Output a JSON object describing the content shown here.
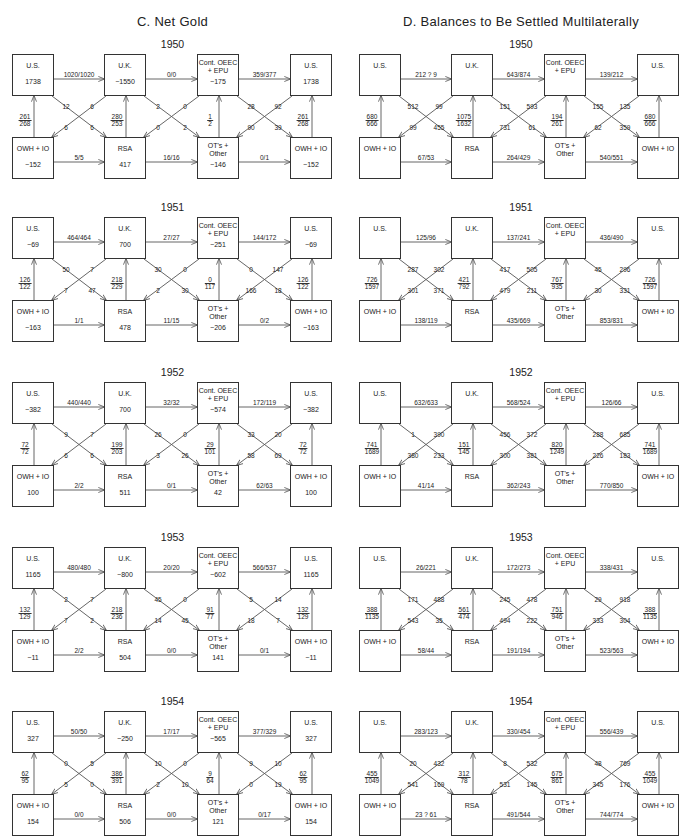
{
  "panels": [
    {
      "id": "C",
      "title": "C.  Net Gold",
      "years": [
        {
          "year": "1950",
          "values": {
            "us_l": "1738",
            "uk": "−1550",
            "oeec": "−175",
            "us_r": "1738",
            "owh_l": "−152",
            "rsa": "417",
            "ot": "−146",
            "owh_r": "−152"
          },
          "h_top": [
            "1020/1020",
            "0/0",
            "359/377"
          ],
          "h_bot": [
            "5/5",
            "16/16",
            "0/1"
          ],
          "v": [
            [
              "261",
              "268"
            ],
            [
              "280",
              "253"
            ],
            [
              "1",
              "2"
            ],
            [
              "261",
              "268"
            ]
          ],
          "x1": [
            "12",
            "6",
            "6",
            "6"
          ],
          "x2": [
            "2",
            "0",
            "0",
            "2"
          ],
          "x3": [
            "28",
            "92",
            "90",
            "39"
          ]
        },
        {
          "year": "1951",
          "values": {
            "us_l": "−69",
            "uk": "700",
            "oeec": "−251",
            "us_r": "−69",
            "owh_l": "−163",
            "rsa": "478",
            "ot": "−206",
            "owh_r": "−163"
          },
          "h_top": [
            "464/464",
            "27/27",
            "144/172"
          ],
          "h_bot": [
            "1/1",
            "11/15",
            "0/2"
          ],
          "v": [
            [
              "126",
              "122"
            ],
            [
              "218",
              "229"
            ],
            [
              "0",
              "117"
            ],
            [
              "126",
              "122"
            ]
          ],
          "x1": [
            "50",
            "7",
            "7",
            "47"
          ],
          "x2": [
            "30",
            "0",
            "2",
            "30"
          ],
          "x3": [
            "0",
            "147",
            "166",
            "18"
          ]
        },
        {
          "year": "1952",
          "values": {
            "us_l": "−382",
            "uk": "700",
            "oeec": "−574",
            "us_r": "−382",
            "owh_l": "100",
            "rsa": "511",
            "ot": "42",
            "owh_r": "100"
          },
          "h_top": [
            "440/440",
            "32/32",
            "172/119"
          ],
          "h_bot": [
            "2/2",
            "0/1",
            "62/63"
          ],
          "v": [
            [
              "72",
              "72"
            ],
            [
              "199",
              "203"
            ],
            [
              "29",
              "101"
            ],
            [
              "72",
              "72"
            ]
          ],
          "x1": [
            "9",
            "7",
            "6",
            "6"
          ],
          "x2": [
            "26",
            "0",
            "3",
            "26"
          ],
          "x3": [
            "33",
            "20",
            "58",
            "69"
          ]
        },
        {
          "year": "1953",
          "values": {
            "us_l": "1165",
            "uk": "−800",
            "oeec": "−602",
            "us_r": "1165",
            "owh_l": "−11",
            "rsa": "504",
            "ot": "141",
            "owh_r": "−11"
          },
          "h_top": [
            "480/480",
            "20/20",
            "566/537"
          ],
          "h_bot": [
            "2/2",
            "0/0",
            "0/1"
          ],
          "v": [
            [
              "132",
              "129"
            ],
            [
              "218",
              "236"
            ],
            [
              "91",
              "77"
            ],
            [
              "132",
              "129"
            ]
          ],
          "x1": [
            "2",
            "7",
            "7",
            "2"
          ],
          "x2": [
            "45",
            "0",
            "14",
            "45"
          ],
          "x3": [
            "5",
            "14",
            "18",
            "7"
          ]
        },
        {
          "year": "1954",
          "values": {
            "us_l": "327",
            "uk": "−250",
            "oeec": "−565",
            "us_r": "327",
            "owh_l": "154",
            "rsa": "506",
            "ot": "121",
            "owh_r": "154"
          },
          "h_top": [
            "50/50",
            "17/17",
            "377/329"
          ],
          "h_bot": [
            "0/0",
            "0/0",
            "0/17"
          ],
          "v": [
            [
              "62",
              "95"
            ],
            [
              "386",
              "391"
            ],
            [
              "9",
              "64"
            ],
            [
              "62",
              "95"
            ]
          ],
          "x1": [
            "0",
            "5",
            "5",
            "0"
          ],
          "x2": [
            "10",
            "0",
            "2",
            "10"
          ],
          "x3": [
            "9",
            "10",
            "0",
            "19"
          ]
        }
      ]
    },
    {
      "id": "D",
      "title": "D.  Balances to Be Settled Multilaterally",
      "years": [
        {
          "year": "1950",
          "values": {
            "us_l": "",
            "uk": "",
            "oeec": "",
            "us_r": "",
            "owh_l": "",
            "rsa": "",
            "ot": "",
            "owh_r": ""
          },
          "h_top": [
            "212 ? 9",
            "643/874",
            "139/212"
          ],
          "h_bot": [
            "67/53",
            "264/429",
            "540/551"
          ],
          "v": [
            [
              "680",
              "666"
            ],
            [
              "1075",
              "1632"
            ],
            [
              "194",
              "261"
            ],
            [
              "680",
              "666"
            ]
          ],
          "x1": [
            "512",
            "99",
            "99",
            "455"
          ],
          "x2": [
            "151",
            "593",
            "731",
            "61"
          ],
          "x3": [
            "155",
            "135",
            "62",
            "359"
          ]
        },
        {
          "year": "1951",
          "values": {
            "us_l": "",
            "uk": "",
            "oeec": "",
            "us_r": "",
            "owh_l": "",
            "rsa": "",
            "ot": "",
            "owh_r": ""
          },
          "h_top": [
            "125/96",
            "137/241",
            "436/490"
          ],
          "h_bot": [
            "138/119",
            "435/669",
            "853/831"
          ],
          "v": [
            [
              "726",
              "1597"
            ],
            [
              "421",
              "792"
            ],
            [
              "767",
              "935"
            ],
            [
              "726",
              "1597"
            ]
          ],
          "x1": [
            "287",
            "302",
            "301",
            "371"
          ],
          "x2": [
            "417",
            "505",
            "479",
            "211"
          ],
          "x3": [
            "45",
            "296",
            "30",
            "331"
          ]
        },
        {
          "year": "1952",
          "values": {
            "us_l": "",
            "uk": "",
            "oeec": "",
            "us_r": "",
            "owh_l": "",
            "rsa": "",
            "ot": "",
            "owh_r": ""
          },
          "h_top": [
            "632/633",
            "568/524",
            "126/66"
          ],
          "h_bot": [
            "41/14",
            "362/243",
            "770/850"
          ],
          "v": [
            [
              "741",
              "1689"
            ],
            [
              "151",
              "145"
            ],
            [
              "820",
              "1249"
            ],
            [
              "741",
              "1689"
            ]
          ],
          "x1": [
            "1",
            "390",
            "380",
            "233"
          ],
          "x2": [
            "456",
            "372",
            "300",
            "381"
          ],
          "x3": [
            "288",
            "685",
            "226",
            "183"
          ]
        },
        {
          "year": "1953",
          "values": {
            "us_l": "",
            "uk": "",
            "oeec": "",
            "us_r": "",
            "owh_l": "",
            "rsa": "",
            "ot": "",
            "owh_r": ""
          },
          "h_top": [
            "26/221",
            "172/273",
            "338/431"
          ],
          "h_bot": [
            "58/44",
            "191/194",
            "523/563"
          ],
          "v": [
            [
              "388",
              "1135"
            ],
            [
              "561",
              "474"
            ],
            [
              "751",
              "946"
            ],
            [
              "388",
              "1135"
            ]
          ],
          "x1": [
            "171",
            "488",
            "543",
            "35"
          ],
          "x2": [
            "245",
            "478",
            "494",
            "222"
          ],
          "x3": [
            "29",
            "918",
            "333",
            "304"
          ]
        },
        {
          "year": "1954",
          "values": {
            "us_l": "",
            "uk": "",
            "oeec": "",
            "us_r": "",
            "owh_l": "",
            "rsa": "",
            "ot": "",
            "owh_r": ""
          },
          "h_top": [
            "283/123",
            "330/454",
            "556/439"
          ],
          "h_bot": [
            "23 ? 61",
            "491/544",
            "744/774"
          ],
          "v": [
            [
              "455",
              "1049"
            ],
            [
              "312",
              "78"
            ],
            [
              "675",
              "861"
            ],
            [
              "455",
              "1049"
            ]
          ],
          "x1": [
            "20",
            "432",
            "541",
            "169"
          ],
          "x2": [
            "8",
            "532",
            "531",
            "145"
          ],
          "x3": [
            "48",
            "769",
            "345",
            "176"
          ]
        }
      ]
    }
  ],
  "box_names": {
    "us": "U.S.",
    "uk": "U.K.",
    "oeec_1": "Cont. OEEC",
    "oeec_2": "+ EPU",
    "owh": "OWH + IO",
    "rsa": "RSA",
    "ot_1": "OT's +",
    "ot_2": "Other"
  },
  "colors": {
    "line": "#555555",
    "box_border": "#333333",
    "text": "#222222"
  }
}
